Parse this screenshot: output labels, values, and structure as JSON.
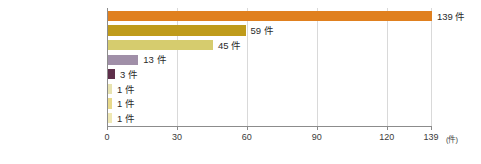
{
  "chart_data": {
    "type": "bar",
    "orientation": "horizontal",
    "title": "",
    "xlabel": "",
    "ylabel": "",
    "unit": "(件)",
    "xlim": [
      0,
      139
    ],
    "grid": true,
    "legend": "none",
    "xticks": [
      {
        "value": 0,
        "label": "0"
      },
      {
        "value": 30,
        "label": "30"
      },
      {
        "value": 60,
        "label": "60"
      },
      {
        "value": 90,
        "label": "90"
      },
      {
        "value": 120,
        "label": "120"
      },
      {
        "value": 139,
        "label": "139"
      }
    ],
    "categories": [
      "マスターベーション",
      "TESE",
      "MD-TESE",
      "MESA",
      "PESA",
      "前立腺マッサージ",
      "ReVSA",
      "電気"
    ],
    "values": [
      139,
      59,
      45,
      13,
      3,
      1,
      1,
      1
    ],
    "value_labels": [
      "139 件",
      "59 件",
      "45 件",
      "13 件",
      "3 件",
      "1 件",
      "1 件",
      "1 件"
    ],
    "bar_colors": [
      "#e0801f",
      "#bf9b1b",
      "#d6cc6e",
      "#a08fa8",
      "#5e2f4a",
      "#e8e3b0",
      "#e8d98a",
      "#efe8b4"
    ]
  },
  "colors": {
    "grid": "#d9d9d9",
    "axis": "#8c8c8c",
    "text": "#2b2b2b",
    "background": "#ffffff"
  }
}
